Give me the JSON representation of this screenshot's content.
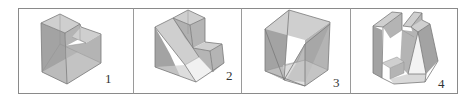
{
  "diagram": {
    "type": "panel-of-3d-solids",
    "colors": {
      "frame": "#8a8a8a",
      "face_dark": "#a3a3a3",
      "face_mid": "#b4b4b4",
      "face_light": "#cfcfcf",
      "edge": "#7a7a7a",
      "label": "#333333"
    },
    "panels": [
      {
        "id": 1,
        "label": "1",
        "shape": "stepped block with cut-out top corner"
      },
      {
        "id": 2,
        "label": "2",
        "shape": "L-step block with diagonal sloped face"
      },
      {
        "id": 3,
        "label": "3",
        "shape": "cube with V-shaped wedge cut"
      },
      {
        "id": 4,
        "label": "4",
        "shape": "block with two upright pillars and triangular cut"
      }
    ]
  }
}
